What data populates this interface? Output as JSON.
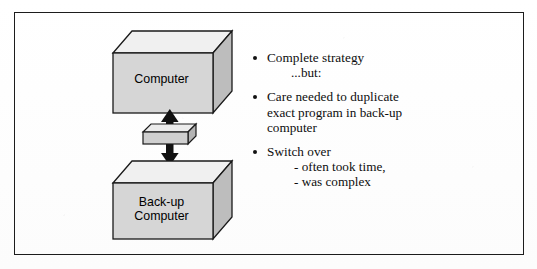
{
  "figure": {
    "frame_color": "#1c1c1c",
    "page_background": "#ffffff"
  },
  "diagram": {
    "boxes": [
      {
        "id": "computer",
        "label": "Computer",
        "role": "primary computer",
        "face_color": "#d4d4d4",
        "top_color": "#f0f0f0",
        "side_color": "#b9b9b9",
        "outline_color": "#1a1a1a"
      },
      {
        "id": "backup-computer",
        "label": "Back-up\nComputer",
        "role": "standby computer",
        "face_color": "#d4d4d4",
        "top_color": "#f0f0f0",
        "side_color": "#b9b9b9",
        "outline_color": "#1a1a1a"
      }
    ],
    "connector": {
      "id": "switch-block",
      "label": "",
      "description": "switch-over block",
      "arrow_up": "arrow-up-icon",
      "arrow_down": "arrow-down-icon",
      "face_color": "#cfcfcf",
      "top_color": "#ececec",
      "side_color": "#b4b4b4"
    }
  },
  "bullets": [
    {
      "marker": "•",
      "lines": [
        "Complete strategy"
      ],
      "sub_note": "...but:",
      "sub_items": []
    },
    {
      "marker": "•",
      "lines": [
        "Care needed to duplicate",
        "exact program in back-up",
        "computer"
      ],
      "sub_note": "",
      "sub_items": []
    },
    {
      "marker": "•",
      "lines": [
        "Switch over"
      ],
      "sub_note": "",
      "sub_items": [
        "- often took time,",
        "- was complex"
      ]
    }
  ]
}
